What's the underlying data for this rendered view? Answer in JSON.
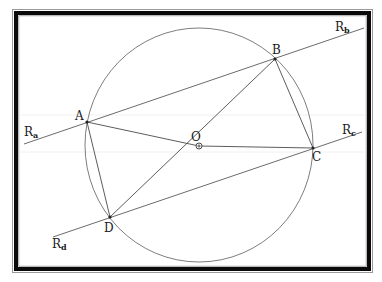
{
  "figure": {
    "colors": {
      "frame": "#0a0a0a",
      "lines": "#4a4a4a",
      "background": "#ffffff"
    }
  },
  "points": {
    "A": {
      "label": "A"
    },
    "B": {
      "label": "B"
    },
    "C": {
      "label": "C"
    },
    "D": {
      "label": "D"
    },
    "O": {
      "label": "O"
    }
  },
  "lines": {
    "Ra": {
      "label": "R",
      "sub": "a"
    },
    "Rb": {
      "label": "R",
      "sub": "b"
    },
    "Rc": {
      "label": "R",
      "sub": "c"
    },
    "Rd": {
      "label": "R",
      "sub": "d"
    }
  },
  "segments": [
    "AB",
    "BC",
    "CD",
    "DA",
    "OA",
    "OB",
    "OC",
    "OD"
  ]
}
